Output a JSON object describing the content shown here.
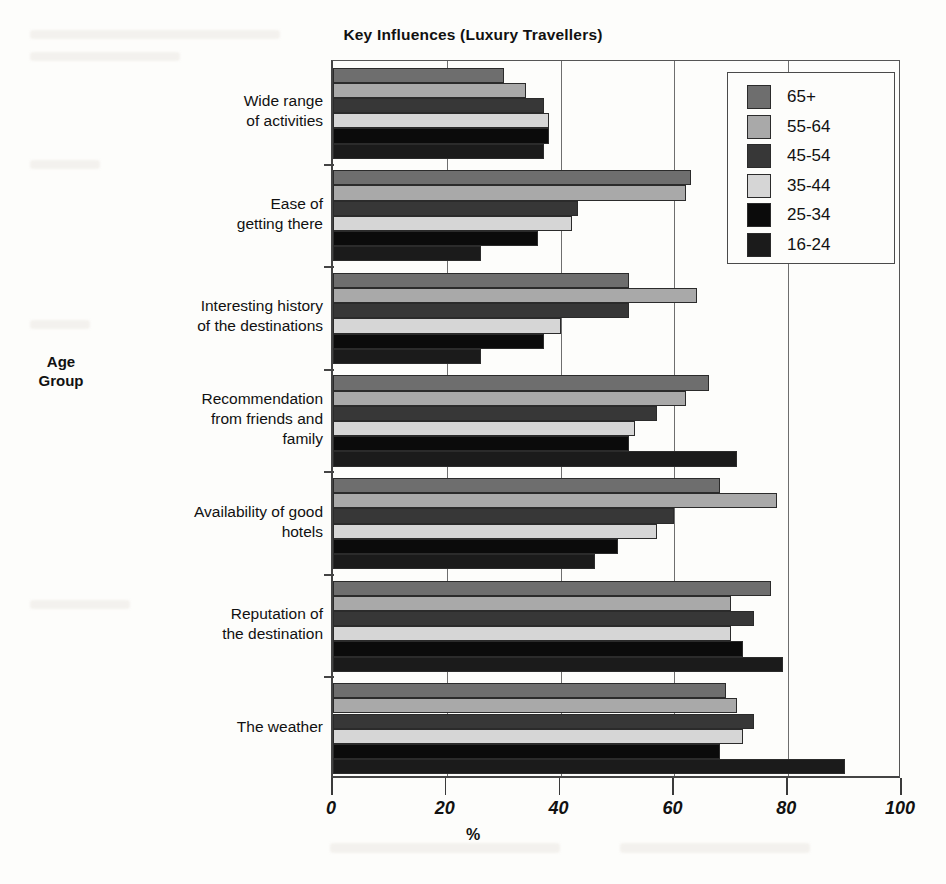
{
  "title": "Key Influences (Luxury Travellers)",
  "axis": {
    "x_title": "%",
    "y_title_line1": "Age",
    "y_title_line2": "Group",
    "x_ticks": [
      "0",
      "20",
      "40",
      "60",
      "80",
      "100"
    ]
  },
  "legend": {
    "items": [
      {
        "label": "65+",
        "color": "#6e6e6e"
      },
      {
        "label": "55-64",
        "color": "#a9a9a9"
      },
      {
        "label": "45-54",
        "color": "#373737"
      },
      {
        "label": "35-44",
        "color": "#d6d6d6"
      },
      {
        "label": "25-34",
        "color": "#0b0b0b"
      },
      {
        "label": "16-24",
        "color": "#1b1b1b"
      }
    ]
  },
  "chart_data": {
    "type": "bar",
    "orientation": "horizontal",
    "title": "Key Influences (Luxury Travellers)",
    "xlabel": "%",
    "ylabel": "Age Group",
    "xlim": [
      0,
      100
    ],
    "xticks": [
      0,
      20,
      40,
      60,
      80,
      100
    ],
    "grid": true,
    "legend_position": "top-right",
    "categories": [
      "Wide range of activities",
      "Ease of getting there",
      "Interesting history of the destinations",
      "Recommendation from friends and family",
      "Availability of good hotels",
      "Reputation of the destination",
      "The weather"
    ],
    "series": [
      {
        "name": "65+",
        "color": "#6e6e6e",
        "values": [
          30,
          63,
          52,
          66,
          68,
          77,
          69
        ]
      },
      {
        "name": "55-64",
        "color": "#a9a9a9",
        "values": [
          34,
          62,
          64,
          62,
          78,
          70,
          71
        ]
      },
      {
        "name": "45-54",
        "color": "#373737",
        "values": [
          37,
          43,
          52,
          57,
          60,
          74,
          74
        ]
      },
      {
        "name": "35-44",
        "color": "#d6d6d6",
        "values": [
          38,
          42,
          40,
          53,
          57,
          70,
          72
        ]
      },
      {
        "name": "25-34",
        "color": "#0b0b0b",
        "values": [
          38,
          36,
          37,
          52,
          50,
          72,
          68
        ]
      },
      {
        "name": "16-24",
        "color": "#1b1b1b",
        "values": [
          37,
          26,
          26,
          71,
          46,
          79,
          90
        ]
      }
    ]
  },
  "y_labels": [
    [
      "Wide range",
      "of activities"
    ],
    [
      "Ease of",
      "getting there"
    ],
    [
      "Interesting history",
      "of the destinations"
    ],
    [
      "Recommendation",
      "from friends and",
      "family"
    ],
    [
      "Availability of good",
      "hotels"
    ],
    [
      "Reputation of",
      "the destination"
    ],
    [
      "The weather"
    ]
  ]
}
